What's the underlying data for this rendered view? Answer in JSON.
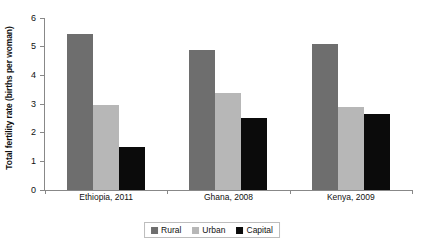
{
  "chart_data": {
    "type": "bar",
    "title": "",
    "xlabel": "",
    "ylabel": "Total fertility rate (births per woman)",
    "ylim": [
      0,
      6
    ],
    "yticks": [
      0,
      1,
      2,
      3,
      4,
      5,
      6
    ],
    "ytick_labels": [
      "0",
      "1",
      "2",
      "3",
      "4",
      "5",
      "6"
    ],
    "grid": false,
    "legend_position": "bottom-center",
    "categories": [
      "Ethiopia, 2011",
      "Ghana, 2008",
      "Kenya, 2009"
    ],
    "series": [
      {
        "name": "Rural",
        "color": "#6e6e6e",
        "values": [
          5.45,
          4.9,
          5.1
        ]
      },
      {
        "name": "Urban",
        "color": "#b7b7b7",
        "values": [
          2.95,
          3.4,
          2.9
        ]
      },
      {
        "name": "Capital",
        "color": "#0b0b0b",
        "values": [
          1.5,
          2.5,
          2.65
        ]
      }
    ]
  },
  "legend": {
    "items": [
      {
        "label": "Rural"
      },
      {
        "label": "Urban"
      },
      {
        "label": "Capital"
      }
    ]
  }
}
